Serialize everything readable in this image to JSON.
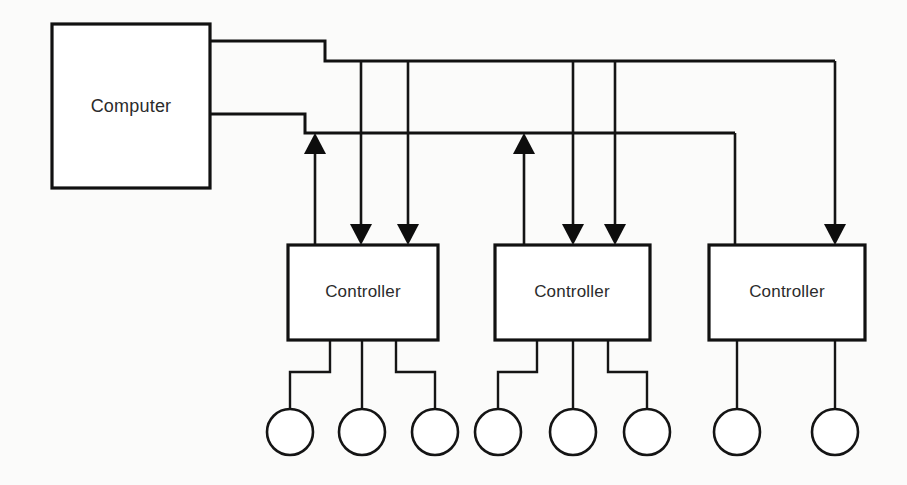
{
  "diagram": {
    "kind": "block-diagram",
    "background_color": "#fbfbfa",
    "line_color": "#111111",
    "box_fill": "#ffffff",
    "nodes": {
      "computer": {
        "label": "Computer",
        "x": 52,
        "y": 24,
        "w": 158,
        "h": 164
      },
      "controllers": [
        {
          "label": "Controller",
          "x": 288,
          "y": 245,
          "w": 150,
          "h": 95
        },
        {
          "label": "Controller",
          "x": 495,
          "y": 245,
          "w": 155,
          "h": 95
        },
        {
          "label": "Controller",
          "x": 709,
          "y": 245,
          "w": 156,
          "h": 95
        }
      ],
      "devices": [
        {
          "cx": 290,
          "cy": 432,
          "r": 23
        },
        {
          "cx": 362,
          "cy": 432,
          "r": 23
        },
        {
          "cx": 435,
          "cy": 432,
          "r": 23
        },
        {
          "cx": 498,
          "cy": 432,
          "r": 23
        },
        {
          "cx": 573,
          "cy": 432,
          "r": 23
        },
        {
          "cx": 647,
          "cy": 432,
          "r": 23
        },
        {
          "cx": 737,
          "cy": 432,
          "r": 23
        },
        {
          "cx": 835,
          "cy": 432,
          "r": 23
        }
      ]
    },
    "buses": {
      "upper": {
        "name": "upper-bus",
        "description": "Outbound bus from computer top-right to controllers",
        "path": "M 210 41 L 325 41 L 325 61 L 835 61"
      },
      "lower": {
        "name": "lower-bus",
        "description": "Inbound bus from computer right side to controllers",
        "path": "M 210 114 L 305 114 L 305 133 L 735 133"
      }
    },
    "links": [
      {
        "name": "ctrl1-status-up",
        "dir": "up",
        "path": "M 315 245 L 315 140",
        "arrow_at": {
          "x": 315,
          "y": 133
        }
      },
      {
        "name": "ctrl1-cmd-down-a",
        "dir": "down",
        "path": "M 361 61 L 361 237",
        "arrow_at": {
          "x": 361,
          "y": 245
        }
      },
      {
        "name": "ctrl1-cmd-down-b",
        "dir": "down",
        "path": "M 408 61 L 408 237",
        "arrow_at": {
          "x": 408,
          "y": 245
        }
      },
      {
        "name": "ctrl2-status-up",
        "dir": "up",
        "path": "M 524 245 L 524 140",
        "arrow_at": {
          "x": 524,
          "y": 133
        }
      },
      {
        "name": "ctrl2-cmd-down-a",
        "dir": "down",
        "path": "M 573 61 L 573 237",
        "arrow_at": {
          "x": 573,
          "y": 245
        }
      },
      {
        "name": "ctrl2-cmd-down-b",
        "dir": "down",
        "path": "M 615 61 L 615 237",
        "arrow_at": {
          "x": 615,
          "y": 245
        }
      },
      {
        "name": "ctrl3-status-line",
        "dir": "none",
        "path": "M 735 133 L 735 245",
        "arrow_at": null
      },
      {
        "name": "ctrl3-cmd-down",
        "dir": "down",
        "path": "M 835 61 L 835 237",
        "arrow_at": {
          "x": 835,
          "y": 245
        }
      }
    ],
    "drops": [
      {
        "name": "drop-1",
        "path": "M 330 340 L 330 372 L 290 372 L 290 409"
      },
      {
        "name": "drop-2",
        "path": "M 362 340 L 362 409"
      },
      {
        "name": "drop-3",
        "path": "M 396 340 L 396 372 L 435 372 L 435 409"
      },
      {
        "name": "drop-4",
        "path": "M 537 340 L 537 372 L 498 372 L 498 409"
      },
      {
        "name": "drop-5",
        "path": "M 573 340 L 573 409"
      },
      {
        "name": "drop-6",
        "path": "M 608 340 L 608 372 L 647 372 L 647 409"
      },
      {
        "name": "drop-7",
        "path": "M 737 340 L 737 409"
      },
      {
        "name": "drop-8",
        "path": "M 835 340 L 835 409"
      }
    ]
  }
}
